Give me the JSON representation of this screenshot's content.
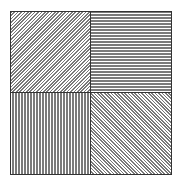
{
  "artwork": {
    "description": "Square divided into four quadrants filled with line patterns",
    "line_color": "#7a7a7a",
    "border_color": "#333333",
    "background": "#ffffff",
    "quadrants": [
      {
        "position": "top-left",
        "pattern": "diagonal-up-right"
      },
      {
        "position": "top-right",
        "pattern": "horizontal"
      },
      {
        "position": "bottom-left",
        "pattern": "vertical"
      },
      {
        "position": "bottom-right",
        "pattern": "diagonal-down-right"
      }
    ]
  }
}
